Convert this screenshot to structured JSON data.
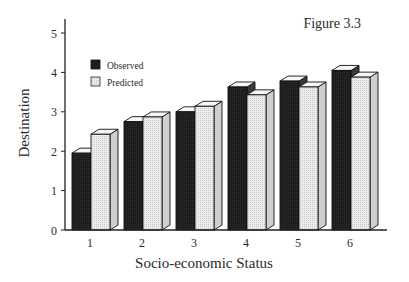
{
  "chart_data": {
    "type": "bar",
    "title": "Figure 3.3",
    "xlabel": "Socio-economic Status",
    "ylabel": "Destination",
    "categories": [
      "1",
      "2",
      "3",
      "4",
      "5",
      "6"
    ],
    "series": [
      {
        "name": "Observed",
        "values": [
          1.95,
          2.75,
          3.0,
          3.63,
          3.78,
          4.05
        ],
        "color": "#1e1e1e"
      },
      {
        "name": "Predicted",
        "values": [
          2.43,
          2.87,
          3.14,
          3.43,
          3.63,
          3.88
        ],
        "color": "#e6e6e6"
      }
    ],
    "ylim": [
      0,
      5
    ],
    "yticks": [
      "0",
      "1",
      "2",
      "3",
      "4",
      "5"
    ],
    "grid": false,
    "legend_position": "upper-left-inside",
    "style": "3d-bars"
  }
}
